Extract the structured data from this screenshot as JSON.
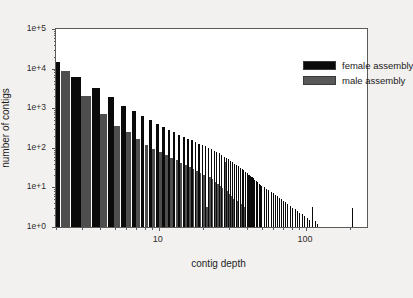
{
  "chart_data": {
    "type": "bar",
    "title": "",
    "xlabel": "contig depth",
    "ylabel": "number of contigs",
    "xscale": "log",
    "yscale": "log",
    "xlim": [
      2,
      260
    ],
    "ylim": [
      1,
      100000
    ],
    "grid": false,
    "legend_position": "top-right",
    "y_tick_labels": [
      "1e+0",
      "1e+1",
      "1e+2",
      "1e+3",
      "1e+4",
      "1e+5"
    ],
    "y_tick_values": [
      1,
      10,
      100,
      1000,
      10000,
      100000
    ],
    "x_tick_labels": [
      "10",
      "100"
    ],
    "x_tick_values": [
      10,
      100
    ],
    "series": [
      {
        "name": "female assembly",
        "color": "#0a0a0a",
        "x": [
          2,
          3,
          4,
          5,
          6,
          7,
          8,
          9,
          10,
          11,
          12,
          13,
          14,
          15,
          16,
          17,
          18,
          19,
          20,
          21,
          22,
          23,
          24,
          25,
          26,
          27,
          28,
          29,
          30,
          31,
          32,
          33,
          34,
          35,
          36,
          37,
          38,
          39,
          40,
          41,
          42,
          43,
          44,
          45,
          46,
          47,
          48,
          49,
          50,
          52,
          54,
          56,
          58,
          60,
          62,
          64,
          66,
          68,
          70,
          72,
          75,
          78,
          81,
          84,
          87,
          90,
          94,
          98,
          102,
          106,
          110,
          115,
          120,
          126,
          132,
          140,
          150,
          162,
          175,
          190,
          205,
          225,
          245
        ],
        "values": [
          15000,
          6000,
          3200,
          1900,
          1150,
          850,
          620,
          500,
          400,
          330,
          280,
          245,
          215,
          190,
          170,
          155,
          140,
          128,
          118,
          108,
          100,
          92,
          85,
          78,
          72,
          66,
          60,
          56,
          51,
          47,
          43,
          40,
          37,
          34,
          31,
          29,
          27,
          25,
          23,
          21,
          19.5,
          18,
          17,
          15.5,
          14.5,
          13.5,
          12.5,
          11.5,
          11,
          10,
          9.2,
          8.5,
          7.8,
          7.2,
          6.6,
          6,
          5.5,
          5,
          4.6,
          4.2,
          3.8,
          3.4,
          3.1,
          2.8,
          2.5,
          2.3,
          2.1,
          1.9,
          1.7,
          1.5,
          3.2,
          1.4,
          1.2,
          1,
          1,
          1,
          1,
          1,
          1,
          1,
          3,
          1,
          1
        ]
      },
      {
        "name": "male assembly",
        "color": "#4e4e4e",
        "x": [
          2,
          3,
          4,
          5,
          6,
          7,
          8,
          9,
          10,
          11,
          12,
          13,
          14,
          15,
          16,
          17,
          18,
          19,
          20,
          21,
          22,
          23,
          24,
          25,
          26,
          27,
          28,
          29,
          30,
          31,
          32,
          34,
          36,
          38
        ],
        "values": [
          8700,
          2050,
          730,
          350,
          250,
          165,
          120,
          95,
          80,
          66,
          56,
          48,
          42,
          37,
          33,
          29,
          26,
          23,
          21,
          3.2,
          18,
          16,
          14,
          12.5,
          11,
          9.5,
          45,
          8,
          7,
          6,
          5.2,
          4.5,
          3.8,
          3.2
        ]
      }
    ]
  },
  "legend": {
    "items": [
      {
        "label": "female assembly",
        "swatch": "female"
      },
      {
        "label": "male assembly",
        "swatch": "male"
      }
    ]
  },
  "axes": {
    "y_title": "number of contigs",
    "x_title": "contig depth"
  }
}
